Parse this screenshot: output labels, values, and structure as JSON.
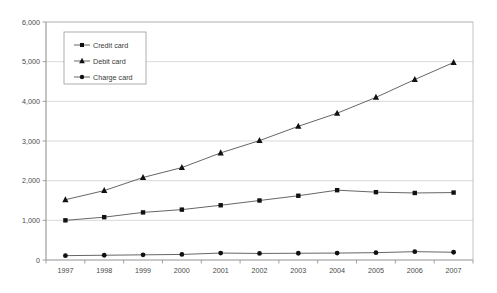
{
  "chart_data": {
    "type": "line",
    "title": "",
    "subtitle": "",
    "xlabel": "",
    "ylabel": "",
    "categories": [
      "1997",
      "1998",
      "1999",
      "2000",
      "2001",
      "2002",
      "2003",
      "2004",
      "2005",
      "2006",
      "2007"
    ],
    "x_tick_labels": [
      "1997",
      "1998",
      "1999",
      "2000",
      "2001",
      "2002",
      "2003",
      "2004",
      "2005",
      "2006",
      "2007"
    ],
    "y_tick_labels": [
      "0",
      "1,000",
      "2,000",
      "3,000",
      "4,000",
      "5,000",
      "6,000"
    ],
    "y_ticks": [
      0,
      1000,
      2000,
      3000,
      4000,
      5000,
      6000
    ],
    "ylim": [
      0,
      6000
    ],
    "grid": true,
    "legend_position": "upper-left-inside",
    "series": [
      {
        "name": "Credit card",
        "marker": "square",
        "color": "#111111",
        "values": [
          1000,
          1080,
          1200,
          1270,
          1380,
          1500,
          1620,
          1760,
          1710,
          1690,
          1700
        ]
      },
      {
        "name": "Debit card",
        "marker": "triangle",
        "color": "#111111",
        "values": [
          1520,
          1750,
          2080,
          2330,
          2700,
          3010,
          3370,
          3700,
          4100,
          4550,
          4980
        ]
      },
      {
        "name": "Charge card",
        "marker": "circle",
        "color": "#111111",
        "values": [
          110,
          120,
          130,
          140,
          175,
          165,
          170,
          175,
          185,
          210,
          195
        ]
      }
    ]
  },
  "legend": {
    "items": [
      {
        "label": "Credit card",
        "marker": "square"
      },
      {
        "label": "Debit card",
        "marker": "triangle"
      },
      {
        "label": "Charge card",
        "marker": "circle"
      }
    ]
  }
}
